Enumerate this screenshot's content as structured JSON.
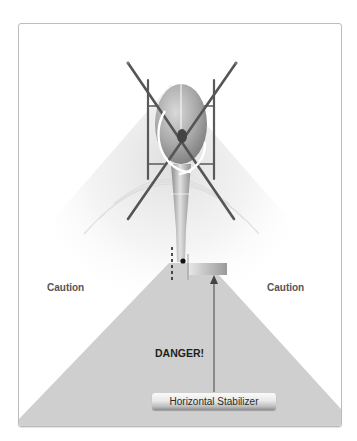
{
  "diagram": {
    "type": "helicopter-tail-rotor-hazard-zones",
    "labels": {
      "caution_left": "Caution",
      "caution_right": "Caution",
      "danger": "DANGER!",
      "horizontal_stabilizer": "Horizontal Stabilizer"
    },
    "colors": {
      "danger_zone": "#cfcfcf",
      "panel_border": "#bdbdbd",
      "rotor_blade": "#555555",
      "fuselage": "#a9a9a9",
      "background": "#ffffff"
    }
  }
}
